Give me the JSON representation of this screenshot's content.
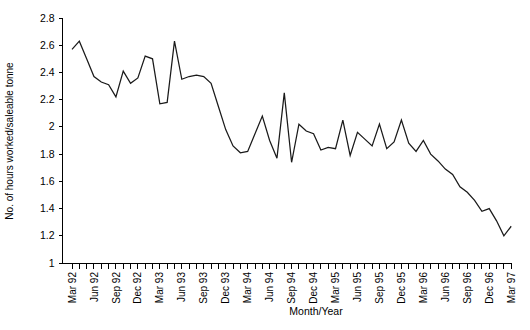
{
  "chart_data": {
    "type": "line",
    "title": "",
    "xlabel": "Month/Year",
    "ylabel": "No. of hours worked/saleable tonne",
    "ylim": [
      1,
      2.8
    ],
    "yticks": [
      "1",
      "1.2",
      "1.4",
      "1.6",
      "1.8",
      "2",
      "2.2",
      "2.4",
      "2.6",
      "2.8"
    ],
    "ytick_values": [
      1,
      1.2,
      1.4,
      1.6,
      1.8,
      2,
      2.2,
      2.4,
      2.6,
      2.8
    ],
    "grid": false,
    "legend": false,
    "minor_tick_interval": "monthly",
    "major_tick_interval": "quarterly",
    "xtick_labels": [
      "Mar 92",
      "Jun 92",
      "Sep 92",
      "Dec 92",
      "Mar 93",
      "Jun 93",
      "Sep 93",
      "Dec 93",
      "Mar 94",
      "Jun 94",
      "Sep 94",
      "Dec 94",
      "Mar 95",
      "Jun 95",
      "Sep 95",
      "Dec 95",
      "Mar 96",
      "Jun 96",
      "Sep 96",
      "Dec 96",
      "Mar 97"
    ],
    "x": [
      "Mar 92",
      "Apr 92",
      "May 92",
      "Jun 92",
      "Jul 92",
      "Aug 92",
      "Sep 92",
      "Oct 92",
      "Nov 92",
      "Dec 92",
      "Jan 93",
      "Feb 93",
      "Mar 93",
      "Apr 93",
      "May 93",
      "Jun 93",
      "Jul 93",
      "Aug 93",
      "Sep 93",
      "Oct 93",
      "Nov 93",
      "Dec 93",
      "Jan 94",
      "Feb 94",
      "Mar 94",
      "Apr 94",
      "May 94",
      "Jun 94",
      "Jul 94",
      "Aug 94",
      "Sep 94",
      "Oct 94",
      "Nov 94",
      "Dec 94",
      "Jan 95",
      "Feb 95",
      "Mar 95",
      "Apr 95",
      "May 95",
      "Jun 95",
      "Jul 95",
      "Aug 95",
      "Sep 95",
      "Oct 95",
      "Nov 95",
      "Dec 95",
      "Jan 96",
      "Feb 96",
      "Mar 96",
      "Apr 96",
      "May 96",
      "Jun 96",
      "Jul 96",
      "Aug 96",
      "Sep 96",
      "Oct 96",
      "Nov 96",
      "Dec 96",
      "Jan 97",
      "Feb 97",
      "Mar 97"
    ],
    "values": [
      2.57,
      2.63,
      2.5,
      2.37,
      2.33,
      2.31,
      2.22,
      2.41,
      2.32,
      2.36,
      2.52,
      2.5,
      2.17,
      2.18,
      2.63,
      2.35,
      2.37,
      2.38,
      2.37,
      2.32,
      2.15,
      1.98,
      1.86,
      1.81,
      1.82,
      1.95,
      2.08,
      1.9,
      1.77,
      2.25,
      1.74,
      2.02,
      1.97,
      1.95,
      1.83,
      1.85,
      1.84,
      2.05,
      1.79,
      1.96,
      1.91,
      1.86,
      2.02,
      1.84,
      1.89,
      2.05,
      1.88,
      1.82,
      1.9,
      1.8,
      1.75,
      1.69,
      1.65,
      1.56,
      1.52,
      1.46,
      1.38,
      1.4,
      1.31,
      1.2,
      1.27
    ],
    "series_name": "Hours worked per saleable tonne"
  }
}
